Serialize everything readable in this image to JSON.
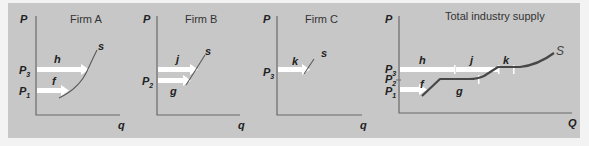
{
  "panels": [
    {
      "title": "Firm A",
      "y_axis": "P",
      "x_axis": "q",
      "curve_label": "s",
      "price_labels": [
        {
          "p": "P",
          "sub": "3"
        },
        {
          "p": "P",
          "sub": "1"
        }
      ],
      "segments": [
        "h",
        "f"
      ]
    },
    {
      "title": "Firm B",
      "y_axis": "P",
      "x_axis": "q",
      "curve_label": "s",
      "price_labels": [
        {
          "p": "P",
          "sub": "2"
        }
      ],
      "segments": [
        "j",
        "g"
      ]
    },
    {
      "title": "Firm C",
      "y_axis": "P",
      "x_axis": "q",
      "curve_label": "s",
      "price_labels": [
        {
          "p": "P",
          "sub": "3"
        }
      ],
      "segments": [
        "k"
      ]
    },
    {
      "title": "Total industry supply",
      "y_axis": "P",
      "x_axis": "Q",
      "curve_label": "S",
      "price_labels": [
        {
          "p": "P",
          "sub": "3"
        },
        {
          "p": "P",
          "sub": "2"
        },
        {
          "p": "P",
          "sub": "1"
        }
      ],
      "segments": [
        "h",
        "j",
        "k",
        "f",
        "g"
      ]
    }
  ],
  "colors": {
    "panel_bg": "#c7c7c7",
    "page_bg": "#f3f3f3",
    "arrow": "#ffffff",
    "supply_line": "#474747"
  }
}
